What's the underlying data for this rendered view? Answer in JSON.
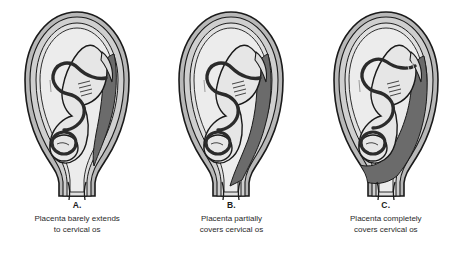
{
  "figure": {
    "background_color": "#ffffff"
  },
  "palette": {
    "outline": "#1a1a1a",
    "uterine_serosa": "#b8b8b8",
    "myometrium": "#cfcfcf",
    "decidua": "#e0e0e0",
    "amniotic_fluid": "#ececec",
    "fetus_fill": "#e6e6e6",
    "placenta_dark": "#6b6b6b",
    "placenta_mid": "#8a8a8a",
    "cord_dark": "#2b2b2b",
    "caption_text": "#2a2a2a"
  },
  "panels": [
    {
      "letter": "A.",
      "caption_line1": "Placenta barely extends",
      "caption_line2": "to cervical os",
      "placenta_position": "right lateral wall, lower edge near internal os",
      "cervix_coverage": "none"
    },
    {
      "letter": "B.",
      "caption_line1": "Placenta partially",
      "caption_line2": "covers cervical os",
      "placenta_position": "right lateral wall extending into lower segment",
      "cervix_coverage": "partial"
    },
    {
      "letter": "C.",
      "caption_line1": "Placenta completely",
      "caption_line2": "covers cervical os",
      "placenta_position": "spans lower uterine segment across internal os",
      "cervix_coverage": "complete"
    }
  ]
}
